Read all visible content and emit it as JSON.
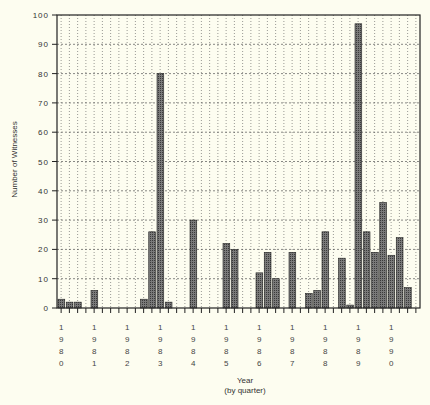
{
  "chart_data": {
    "type": "bar",
    "title": "",
    "xlabel": "Year",
    "xlabel_sub": "(by quarter)",
    "ylabel": "Number of Witnesses",
    "ylim": [
      0,
      100
    ],
    "yticks": [
      0,
      10,
      20,
      30,
      40,
      50,
      60,
      70,
      80,
      90,
      100
    ],
    "grid": true,
    "legend": null,
    "years": [
      "1980",
      "1981",
      "1982",
      "1983",
      "1984",
      "1985",
      "1986",
      "1987",
      "1988",
      "1989",
      "1990"
    ],
    "quarters_per_year": 4,
    "categories": [
      "1980 Q1",
      "1980 Q2",
      "1980 Q3",
      "1980 Q4",
      "1981 Q1",
      "1981 Q2",
      "1981 Q3",
      "1981 Q4",
      "1982 Q1",
      "1982 Q2",
      "1982 Q3",
      "1982 Q4",
      "1983 Q1",
      "1983 Q2",
      "1983 Q3",
      "1983 Q4",
      "1984 Q1",
      "1984 Q2",
      "1984 Q3",
      "1984 Q4",
      "1985 Q1",
      "1985 Q2",
      "1985 Q3",
      "1985 Q4",
      "1986 Q1",
      "1986 Q2",
      "1986 Q3",
      "1986 Q4",
      "1987 Q1",
      "1987 Q2",
      "1987 Q3",
      "1987 Q4",
      "1988 Q1",
      "1988 Q2",
      "1988 Q3",
      "1988 Q4",
      "1989 Q1",
      "1989 Q2",
      "1989 Q3",
      "1989 Q4",
      "1990 Q1",
      "1990 Q2",
      "1990 Q3",
      "1990 Q4"
    ],
    "values": [
      3,
      2,
      2,
      0,
      6,
      0,
      0,
      0,
      0,
      0,
      3,
      26,
      80,
      2,
      0,
      0,
      30,
      0,
      0,
      0,
      22,
      20,
      0,
      0,
      12,
      19,
      10,
      0,
      19,
      0,
      5,
      6,
      26,
      0,
      17,
      1,
      97,
      26,
      19,
      36,
      18,
      24,
      7,
      0
    ],
    "colors": {
      "bar": "#6b6b6b",
      "bar_edge": "#222222",
      "grid": "#555555",
      "axis": "#222222",
      "background": "#fdfdf0"
    }
  }
}
